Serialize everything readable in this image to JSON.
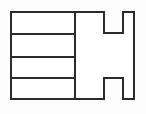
{
  "figure": {
    "type": "line-drawing",
    "canvas": {
      "width": 146,
      "height": 114
    },
    "colors": {
      "background": "#fdfdfd",
      "fill": "#ffffff",
      "stroke": "#2b2b2b"
    },
    "stroke_width": 2,
    "outline_path": "M 11 12 L 104 12 L 104 33 L 123 33 L 123 12 L 134 12 L 134 99 L 123 99 L 123 78 L 104 78 L 104 99 L 11 99 Z",
    "partition": {
      "name": "vertical-partition",
      "x": 75,
      "y1": 12,
      "y2": 99
    },
    "dividers": [
      {
        "name": "shelf-divider-1",
        "x1": 11,
        "x2": 75,
        "y": 34
      },
      {
        "name": "shelf-divider-2",
        "x1": 11,
        "x2": 75,
        "y": 57
      },
      {
        "name": "shelf-divider-3",
        "x1": 11,
        "x2": 75,
        "y": 78
      }
    ],
    "bounds": {
      "left": 11,
      "top": 12,
      "right": 134,
      "bottom": 99
    },
    "notches": [
      {
        "name": "top-notch",
        "x1": 104,
        "x2": 123,
        "depth_y": 33
      },
      {
        "name": "bottom-notch",
        "x1": 104,
        "x2": 123,
        "depth_y": 78
      }
    ]
  }
}
